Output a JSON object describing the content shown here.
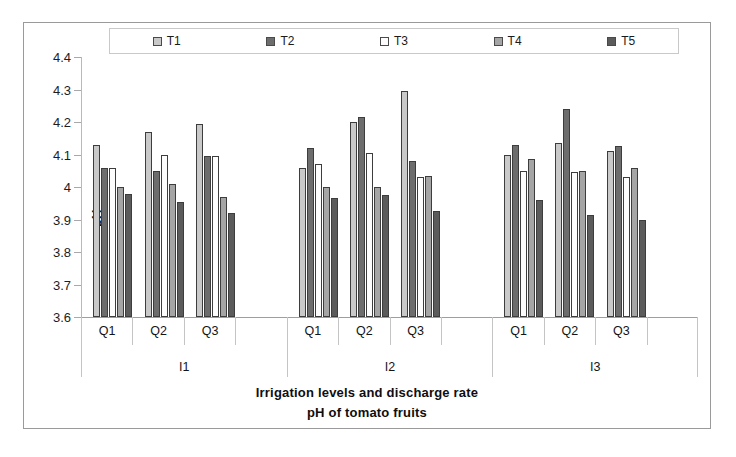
{
  "chart_data": {
    "type": "bar",
    "title": "pH of tomato fruits",
    "xlabel": "Irrigation levels and discharge rate",
    "ylabel": "pH",
    "ylim": [
      3.6,
      4.4
    ],
    "ytick_step": 0.1,
    "yticks": [
      "4.4",
      "4.3",
      "4.2",
      "4.1",
      "4",
      "3.9",
      "3.8",
      "3.7",
      "3.6"
    ],
    "ytick_values": [
      4.4,
      4.3,
      4.2,
      4.1,
      4.0,
      3.9,
      3.8,
      3.7,
      3.6
    ],
    "grid": false,
    "legend_position": "top",
    "categories": [
      "Q1",
      "Q2",
      "Q3"
    ],
    "supergroups": [
      "I1",
      "I2",
      "I3"
    ],
    "series": [
      {
        "name": "T1",
        "color": "#c9c9c9",
        "values": {
          "I1": [
            4.13,
            4.17,
            4.195
          ],
          "I2": [
            4.06,
            4.2,
            4.295
          ],
          "I3": [
            4.1,
            4.135,
            4.11
          ]
        }
      },
      {
        "name": "T2",
        "color": "#6d6d6d",
        "values": {
          "I1": [
            4.06,
            4.05,
            4.095
          ],
          "I2": [
            4.12,
            4.215,
            4.08
          ],
          "I3": [
            4.13,
            4.24,
            4.125
          ]
        }
      },
      {
        "name": "T3",
        "color": "#fdfdfd",
        "values": {
          "I1": [
            4.06,
            4.1,
            4.095
          ],
          "I2": [
            4.07,
            4.105,
            4.03
          ],
          "I3": [
            4.05,
            4.045,
            4.03
          ]
        }
      },
      {
        "name": "T4",
        "color": "#a5a5a5",
        "values": {
          "I1": [
            4.0,
            4.01,
            3.97
          ],
          "I2": [
            4.0,
            4.0,
            4.035
          ],
          "I3": [
            4.085,
            4.05,
            4.06
          ]
        }
      },
      {
        "name": "T5",
        "color": "#5b5b5b",
        "values": {
          "I1": [
            3.98,
            3.955,
            3.92
          ],
          "I2": [
            3.965,
            3.975,
            3.925
          ],
          "I3": [
            3.96,
            3.915,
            3.9
          ]
        }
      }
    ]
  },
  "legend": {
    "items": [
      {
        "label": "T1",
        "color": "#c9c9c9"
      },
      {
        "label": "T2",
        "color": "#6d6d6d"
      },
      {
        "label": "T3",
        "color": "#fdfdfd"
      },
      {
        "label": "T4",
        "color": "#a5a5a5"
      },
      {
        "label": "T5",
        "color": "#5b5b5b"
      }
    ]
  },
  "axes": {
    "y_title": "pH",
    "x_title": "Irrigation levels and discharge rate"
  },
  "caption": "pH of tomato fruits"
}
